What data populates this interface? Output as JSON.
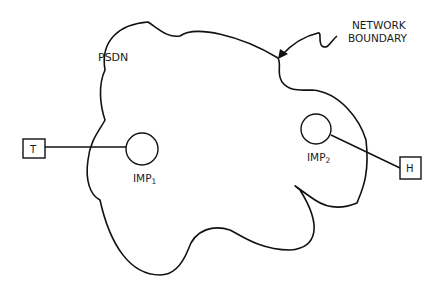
{
  "diagram": {
    "cloud_label": "PSDN",
    "boundary_label_line1": "NETWORK",
    "boundary_label_line2": "BOUNDARY",
    "terminal": {
      "label": "T"
    },
    "host": {
      "label": "H"
    },
    "imp1": {
      "label": "IMP",
      "subscript": "1"
    },
    "imp2": {
      "label": "IMP",
      "subscript": "2"
    },
    "colors": {
      "stroke": "#111111",
      "background": "#ffffff"
    }
  }
}
